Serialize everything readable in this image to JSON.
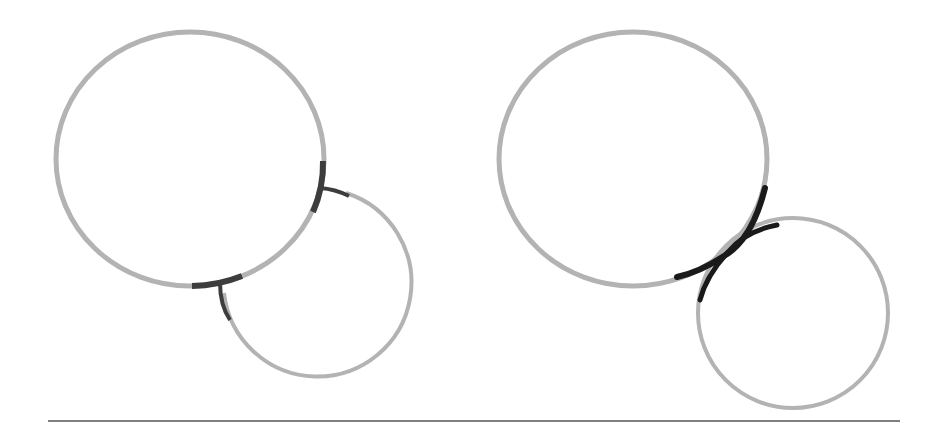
{
  "colors": {
    "background": "#ffffff",
    "circle_stroke": "#b3b3b3",
    "highlight_left": "#3d3d3d",
    "highlight_right": "#1a1a1a",
    "baseline": "#555555"
  },
  "figures": [
    {
      "name": "left-figure",
      "description": "Two circles touching at two junctions (non-tangent intersection)",
      "big_circle": {
        "cx": 190,
        "cy": 159,
        "rx": 134,
        "ry": 127
      },
      "small_circle": {
        "cx": 313,
        "cy": 278,
        "r": 94
      },
      "junctions": 2
    },
    {
      "name": "right-figure",
      "description": "Two circles meeting tangentially at a single crossing point",
      "big_circle": {
        "cx": 633,
        "cy": 159,
        "rx": 134,
        "ry": 127
      },
      "small_circle": {
        "cx": 793,
        "cy": 313,
        "r": 96
      },
      "junctions": 1
    }
  ],
  "baseline": {
    "x1": 48,
    "x2": 900,
    "y": 421
  }
}
